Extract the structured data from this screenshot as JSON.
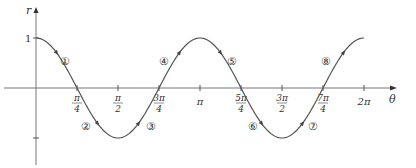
{
  "chart_data": {
    "type": "line",
    "title": "",
    "xlabel": "θ",
    "ylabel": "r",
    "function": "r = cos 2θ",
    "xlim": [
      0,
      6.2832
    ],
    "ylim": [
      -1,
      1
    ],
    "grid": false,
    "x_ticks": [
      {
        "value": 0.7854,
        "num": "π",
        "den": "4"
      },
      {
        "value": 1.5708,
        "num": "π",
        "den": "2"
      },
      {
        "value": 2.3562,
        "num": "3π",
        "den": "4"
      },
      {
        "value": 3.1416,
        "label": "π"
      },
      {
        "value": 3.927,
        "num": "5π",
        "den": "4"
      },
      {
        "value": 4.7124,
        "num": "3π",
        "den": "2"
      },
      {
        "value": 5.4978,
        "num": "7π",
        "den": "4"
      },
      {
        "value": 6.2832,
        "label": "2π"
      }
    ],
    "y_ticks": [
      {
        "value": 1,
        "label": "1"
      },
      {
        "value": -1,
        "label": ""
      }
    ],
    "x": [
      0,
      0.7854,
      1.5708,
      2.3562,
      3.1416,
      3.927,
      4.7124,
      5.4978,
      6.2832
    ],
    "series": [
      {
        "name": "r = cos 2θ",
        "values": [
          1,
          0,
          -1,
          0,
          1,
          0,
          -1,
          0,
          1
        ]
      }
    ],
    "annotations": [
      {
        "label": "①",
        "x": 0.55,
        "y": 0.55
      },
      {
        "label": "②",
        "x": 0.95,
        "y": -0.75
      },
      {
        "label": "③",
        "x": 2.2,
        "y": -0.75
      },
      {
        "label": "④",
        "x": 2.45,
        "y": 0.55
      },
      {
        "label": "⑤",
        "x": 3.75,
        "y": 0.55
      },
      {
        "label": "⑥",
        "x": 4.15,
        "y": -0.75
      },
      {
        "label": "⑦",
        "x": 5.3,
        "y": -0.75
      },
      {
        "label": "⑧",
        "x": 5.55,
        "y": 0.55
      }
    ],
    "color": "#555555"
  },
  "labels": {
    "y_axis": "r",
    "x_axis": "θ",
    "y_one": "1"
  }
}
